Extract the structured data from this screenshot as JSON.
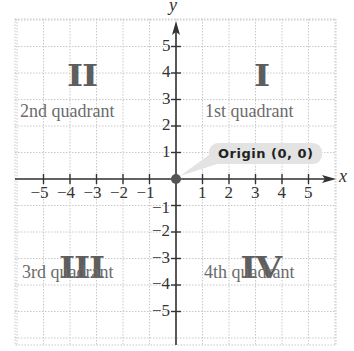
{
  "axes": {
    "x_label": "x",
    "y_label": "y",
    "x_ticks": [
      "-5",
      "-4",
      "-3",
      "-2",
      "-1",
      "1",
      "2",
      "3",
      "4",
      "5"
    ],
    "y_ticks": [
      "5",
      "4",
      "3",
      "2",
      "1",
      "-1",
      "-2",
      "-3",
      "-4",
      "-5"
    ],
    "range": [
      -5,
      5
    ]
  },
  "quadrants": [
    {
      "numeral": "I",
      "label": "1st quadrant"
    },
    {
      "numeral": "II",
      "label": "2nd quadrant"
    },
    {
      "numeral": "III",
      "label": "3rd quadrant"
    },
    {
      "numeral": "IV",
      "label": "4th quadrant"
    }
  ],
  "origin": {
    "label": "Origin (0, 0)",
    "point": [
      0,
      0
    ]
  },
  "colors": {
    "axis": "#333333",
    "grid": "#c8c8c8",
    "quadrant_text": "#6b6b6b",
    "numeral": "#5e5e5e",
    "callout_bg": "#e3e3e3",
    "origin_dot": "#555555"
  }
}
